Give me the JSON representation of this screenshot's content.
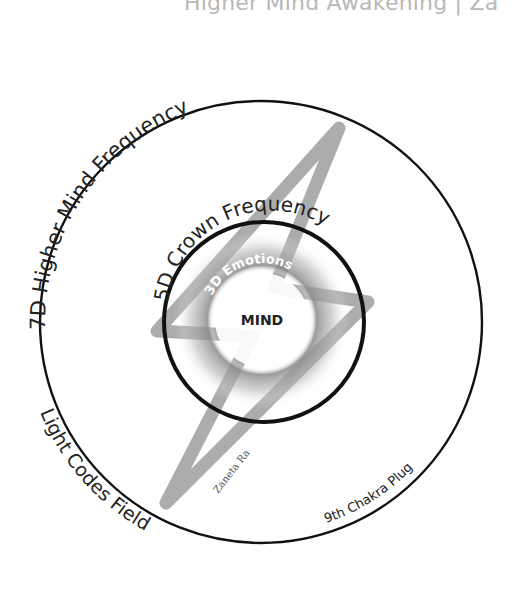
{
  "header": {
    "title": "Higher Mind Awakening | Za"
  },
  "diagram": {
    "outer_ring": {
      "label": "7D Higher Mind Frequency",
      "center": [
        261,
        322
      ],
      "radius": 221
    },
    "middle_ring": {
      "label": "5D Crown Frequency",
      "center": [
        264,
        322
      ],
      "radius": 100
    },
    "inner_ring": {
      "label": "3D Emotions",
      "radius": 58
    },
    "core": {
      "label": "MIND",
      "radius": 48
    },
    "lower_left_label": "Light Codes Field",
    "lower_right_label": "9th Chakra Plug",
    "signature": "Zaneta Ra",
    "lightning_bolt": {
      "color": "#a8a8a8",
      "points": [
        [
          339,
          128
        ],
        [
          157,
          331
        ],
        [
          252,
          336
        ],
        [
          166,
          503
        ],
        [
          368,
          302
        ],
        [
          274,
          288
        ]
      ]
    },
    "colors": {
      "ring_stroke": "#111111",
      "bolt": "#a8a8a8",
      "text": "#222222",
      "header": "#b8b8b8"
    }
  }
}
